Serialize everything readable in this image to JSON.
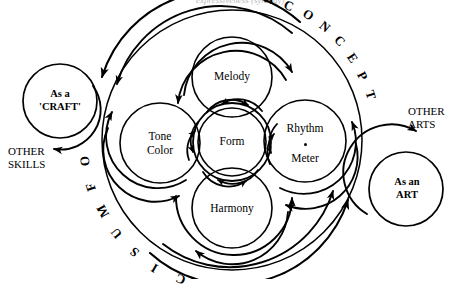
{
  "figure": {
    "title_fragment_clipped": "expressiveness (synergy)",
    "background_color": "#ffffff",
    "stroke_color": "#000000"
  },
  "center": {
    "label": "Form"
  },
  "elements": [
    {
      "id": "melody",
      "label": "Melody",
      "position": "top"
    },
    {
      "id": "tone-color",
      "label_line1": "Tone",
      "label_line2": "Color",
      "position": "left"
    },
    {
      "id": "rhythm",
      "label_line1": "Rhythm",
      "label_line2": "Meter",
      "separator": "•",
      "position": "right"
    },
    {
      "id": "harmony",
      "label": "Harmony",
      "position": "bottom"
    }
  ],
  "arc_text": {
    "upper_right": "A CONCEPT",
    "upper_right_letters": [
      "A",
      "C",
      "O",
      "N",
      "C",
      "E",
      "P",
      "T"
    ],
    "lower_left": "OF MUSIC",
    "lower_left_letters": [
      "O",
      "F",
      "M",
      "U",
      "S",
      "I",
      "C"
    ]
  },
  "left_satellite": {
    "line1": "As a",
    "line2": "'CRAFT'",
    "outbound_label_line1": "OTHER",
    "outbound_label_line2": "SKILLS"
  },
  "right_satellite": {
    "line1": "As an",
    "line2": "ART",
    "outbound_label_line1": "OTHER",
    "outbound_label_line2": "ARTS"
  }
}
